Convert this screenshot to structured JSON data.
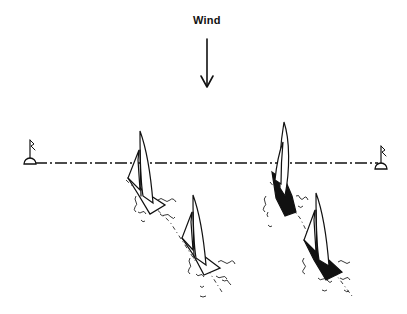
{
  "diagram": {
    "title": "",
    "wind": {
      "label": "Wind",
      "direction": "down"
    },
    "start_line": {
      "style": "dash-dot",
      "left_mark": "buoy-flag",
      "right_mark": "buoy-flag"
    },
    "boats": [
      {
        "id": "left-leading",
        "hull": "white",
        "position": "on line",
        "group": "left"
      },
      {
        "id": "left-trailing",
        "hull": "white",
        "position": "behind",
        "group": "left"
      },
      {
        "id": "right-leading",
        "hull": "black",
        "position": "on line",
        "group": "right"
      },
      {
        "id": "right-trailing",
        "hull": "black",
        "position": "behind",
        "group": "right"
      }
    ],
    "colors": {
      "ink": "#111111",
      "background": "#ffffff"
    }
  }
}
